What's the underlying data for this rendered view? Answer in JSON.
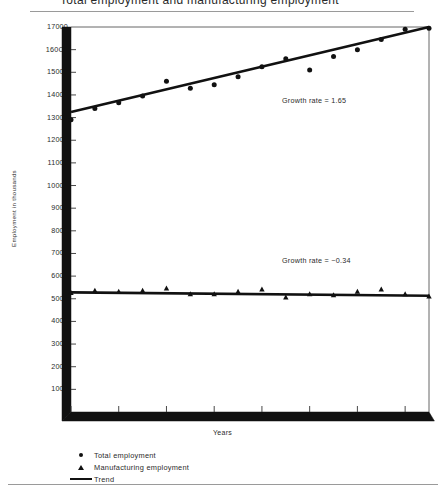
{
  "figure": {
    "title": "Total employment and manufacturing employment",
    "y_axis_title": "Employment in thousands",
    "x_axis_title": "Years"
  },
  "annotations": {
    "total_growth": "Growth rate = 1.65",
    "manufacturing_growth": "Growth rate = −0.34"
  },
  "legend": {
    "items": [
      {
        "label": "Total employment",
        "marker": "circle-marker-icon"
      },
      {
        "label": "Manufacturing employment",
        "marker": "triangle-marker-icon"
      },
      {
        "label": "Trend",
        "marker": "line-marker-icon"
      }
    ]
  },
  "colors": {
    "ink": "#111111",
    "text": "#2b2b2b",
    "rule": "#9a9a9a",
    "background": "#ffffff"
  },
  "chart_data": {
    "type": "scatter",
    "title": "Total employment and manufacturing employment",
    "xlabel": "Years",
    "ylabel": "Employment in thousands",
    "xlim": [
      1965,
      1980
    ],
    "ylim": [
      0,
      17000
    ],
    "ytick_step": 1000,
    "ytick_labels": [
      "0",
      "1000",
      "2000",
      "3000",
      "4000",
      "5000",
      "6000",
      "7000",
      "8000",
      "9000",
      "10000",
      "11000",
      "12000",
      "13000",
      "14000",
      "15000",
      "160C0",
      "17000"
    ],
    "ytick_values": [
      0,
      1000,
      2000,
      3000,
      4000,
      5000,
      6000,
      7000,
      8000,
      9000,
      10000,
      11000,
      12000,
      13000,
      14000,
      15000,
      16000,
      17000
    ],
    "xtick_labels": [
      "1965",
      "1967",
      "1969",
      "1971",
      "1973",
      "1975",
      "1977",
      "1979"
    ],
    "xtick_values": [
      1965,
      1967,
      1969,
      1971,
      1973,
      1975,
      1977,
      1979
    ],
    "minor_xticks": [
      1966,
      1968,
      1970,
      1972,
      1974,
      1976,
      1978
    ],
    "grid": false,
    "legend_position": "below-axes",
    "x": [
      1965,
      1966,
      1967,
      1968,
      1969,
      1970,
      1971,
      1972,
      1973,
      1974,
      1975,
      1976,
      1977,
      1978,
      1979,
      1980
    ],
    "series": [
      {
        "name": "Total employment",
        "marker": "circle",
        "values": [
          12900,
          13400,
          13650,
          13950,
          14600,
          14300,
          14450,
          14800,
          15250,
          15600,
          15100,
          15700,
          16000,
          16450,
          16900,
          16950
        ]
      },
      {
        "name": "Manufacturing employment",
        "marker": "triangle",
        "values": [
          5250,
          5350,
          5300,
          5350,
          5450,
          5200,
          5200,
          5300,
          5400,
          5050,
          5200,
          5150,
          5300,
          5400,
          5200,
          5100
        ]
      }
    ],
    "trends": [
      {
        "name": "Trend (total employment)",
        "growth_rate": 1.65,
        "y_start": 13250,
        "y_end": 17000,
        "x_start": 1965,
        "x_end": 1980
      },
      {
        "name": "Trend (manufacturing employment)",
        "growth_rate": -0.34,
        "y_start": 5280,
        "y_end": 5130,
        "x_start": 1965,
        "x_end": 1980
      }
    ]
  }
}
